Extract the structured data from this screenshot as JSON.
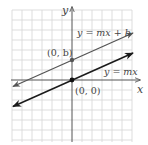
{
  "diagram": {
    "type": "coordinate-plane-lines",
    "axes": {
      "x_label": "x",
      "y_label": "y"
    },
    "grid": {
      "spacing_px": 10,
      "color": "#d4d4d4"
    },
    "lines": [
      {
        "label": "y = mx + b",
        "color": "#555555",
        "passes_through": "(0, b)"
      },
      {
        "label": "y = mx",
        "color": "#1a1a1a",
        "passes_through": "(0, 0)"
      }
    ],
    "points": [
      {
        "label": "(0, b)"
      },
      {
        "label": "(0, 0)"
      }
    ]
  }
}
